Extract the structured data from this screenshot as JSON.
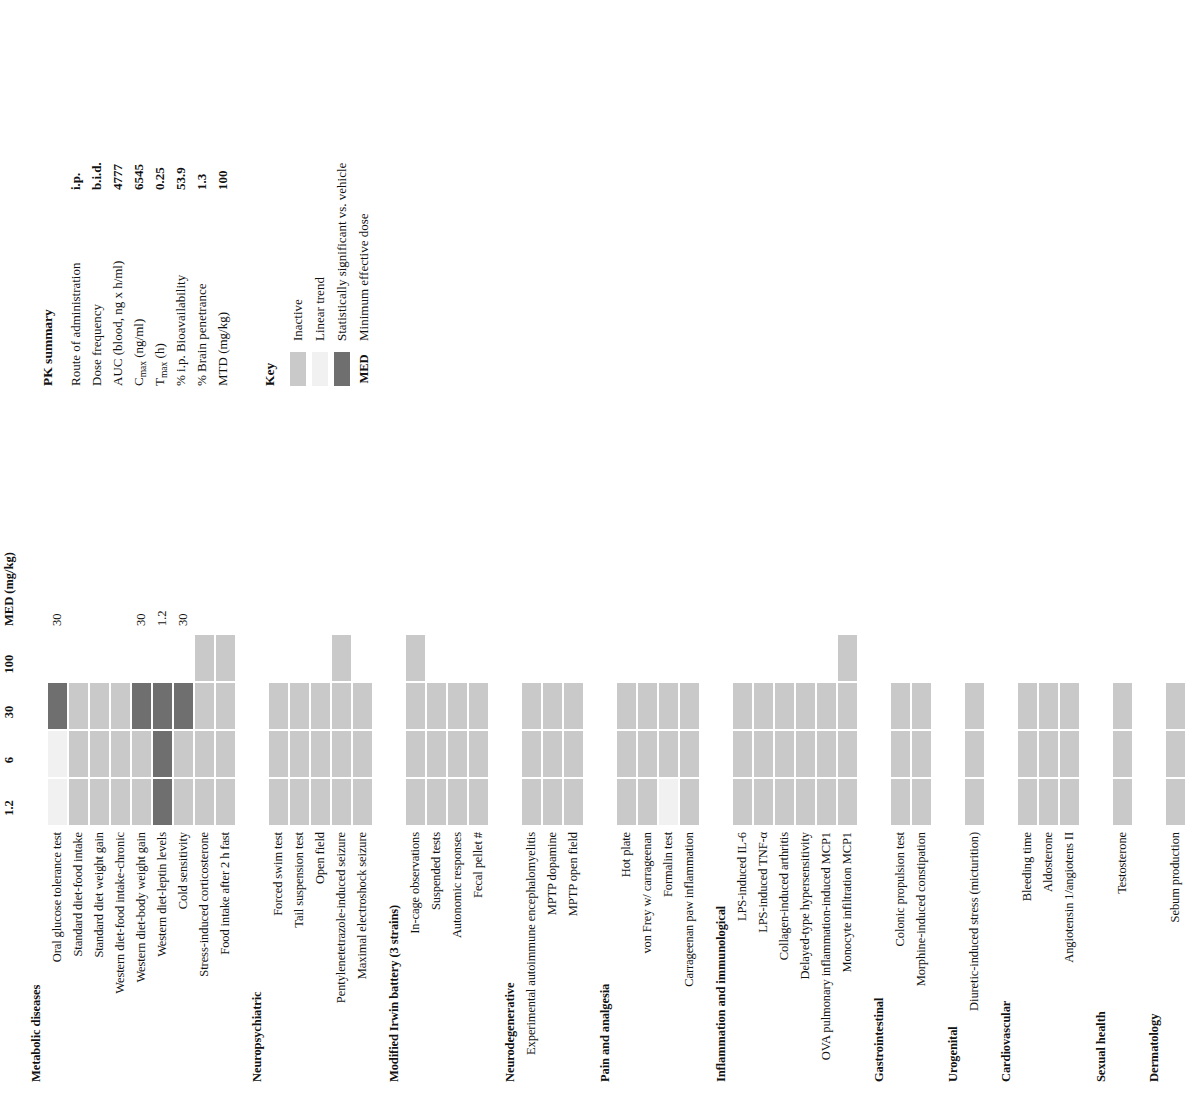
{
  "figure": {
    "dose_axis_title": "Dose (mg/kg)",
    "dose_ticks": [
      "1.2",
      "6",
      "30",
      "100"
    ],
    "med_column_header": "MED (mg/kg)"
  },
  "chart_data": {
    "type": "heatmap",
    "title": "Dose (mg/kg)",
    "xlabel": "Dose (mg/kg)",
    "ylabel": "",
    "categories": [
      "1.2",
      "6",
      "30",
      "100"
    ],
    "extra_column": "MED (mg/kg)",
    "cell_states": [
      "none",
      "inactive",
      "trend",
      "sig"
    ],
    "legend_position": "right",
    "grid": false,
    "sections": [
      {
        "name": "Metabolic diseases",
        "rows": [
          {
            "label": "Oral glucose tolerance test",
            "cells": [
              "trend",
              "trend",
              "sig",
              "none"
            ],
            "med": "30"
          },
          {
            "label": "Standard diet-food intake",
            "cells": [
              "inactive",
              "inactive",
              "inactive",
              "none"
            ],
            "med": ""
          },
          {
            "label": "Standard diet weight gain",
            "cells": [
              "inactive",
              "inactive",
              "inactive",
              "none"
            ],
            "med": ""
          },
          {
            "label": "Western diet-food intake-chronic",
            "cells": [
              "inactive",
              "inactive",
              "inactive",
              "none"
            ],
            "med": ""
          },
          {
            "label": "Western diet-body weight gain",
            "cells": [
              "inactive",
              "inactive",
              "sig",
              "none"
            ],
            "med": "30"
          },
          {
            "label": "Western diet-leptin levels",
            "cells": [
              "sig",
              "sig",
              "sig",
              "none"
            ],
            "med": "1.2"
          },
          {
            "label": "Cold sensitivity",
            "cells": [
              "inactive",
              "inactive",
              "sig",
              "none"
            ],
            "med": "30"
          },
          {
            "label": "Stress-induced corticosterone",
            "cells": [
              "inactive",
              "inactive",
              "inactive",
              "inactive"
            ],
            "med": ""
          },
          {
            "label": "Food intake after 2 h fast",
            "cells": [
              "inactive",
              "inactive",
              "inactive",
              "inactive"
            ],
            "med": ""
          }
        ]
      },
      {
        "name": "Neuropsychiatric",
        "rows": [
          {
            "label": "Forced swim test",
            "cells": [
              "inactive",
              "inactive",
              "inactive",
              "none"
            ],
            "med": ""
          },
          {
            "label": "Tail suspension test",
            "cells": [
              "inactive",
              "inactive",
              "inactive",
              "none"
            ],
            "med": ""
          },
          {
            "label": "Open field",
            "cells": [
              "inactive",
              "inactive",
              "inactive",
              "none"
            ],
            "med": ""
          },
          {
            "label": "Pentylenetetrazole-induced seizure",
            "cells": [
              "inactive",
              "inactive",
              "inactive",
              "inactive"
            ],
            "med": ""
          },
          {
            "label": "Maximal electroshock seizure",
            "cells": [
              "inactive",
              "inactive",
              "inactive",
              "none"
            ],
            "med": ""
          }
        ]
      },
      {
        "name": "Modified Irwin battery (3 strains)",
        "rows": [
          {
            "label": "In-cage observations",
            "cells": [
              "inactive",
              "inactive",
              "inactive",
              "inactive"
            ],
            "med": ""
          },
          {
            "label": "Suspended tests",
            "cells": [
              "inactive",
              "inactive",
              "inactive",
              "none"
            ],
            "med": ""
          },
          {
            "label": "Autonomic responses",
            "cells": [
              "inactive",
              "inactive",
              "inactive",
              "none"
            ],
            "med": ""
          },
          {
            "label": "Fecal pellet #",
            "cells": [
              "inactive",
              "inactive",
              "inactive",
              "none"
            ],
            "med": ""
          }
        ]
      },
      {
        "name": "Neurodegenerative",
        "rows": [
          {
            "label": "Experimental autoimmune encephalomyelitis",
            "cells": [
              "inactive",
              "inactive",
              "inactive",
              "none"
            ],
            "med": ""
          },
          {
            "label": "MPTP dopamine",
            "cells": [
              "inactive",
              "inactive",
              "inactive",
              "none"
            ],
            "med": ""
          },
          {
            "label": "MPTP open field",
            "cells": [
              "inactive",
              "inactive",
              "inactive",
              "none"
            ],
            "med": ""
          }
        ]
      },
      {
        "name": "Pain and analgesia",
        "rows": [
          {
            "label": "Hot plate",
            "cells": [
              "inactive",
              "inactive",
              "inactive",
              "none"
            ],
            "med": ""
          },
          {
            "label": "von Frey w/ carrageenan",
            "cells": [
              "inactive",
              "inactive",
              "inactive",
              "none"
            ],
            "med": ""
          },
          {
            "label": "Formalin test",
            "cells": [
              "trend",
              "inactive",
              "inactive",
              "none"
            ],
            "med": ""
          },
          {
            "label": "Carrageenan paw inflammation",
            "cells": [
              "inactive",
              "inactive",
              "inactive",
              "none"
            ],
            "med": ""
          }
        ]
      },
      {
        "name": "Inflammation and immunological",
        "rows": [
          {
            "label": "LPS-induced IL-6",
            "cells": [
              "inactive",
              "inactive",
              "inactive",
              "none"
            ],
            "med": ""
          },
          {
            "label": "LPS-induced TNF-α",
            "cells": [
              "inactive",
              "inactive",
              "inactive",
              "none"
            ],
            "med": ""
          },
          {
            "label": "Collagen-induced arthritis",
            "cells": [
              "inactive",
              "inactive",
              "inactive",
              "none"
            ],
            "med": ""
          },
          {
            "label": "Delayed-type hypersensitivity",
            "cells": [
              "inactive",
              "inactive",
              "inactive",
              "none"
            ],
            "med": ""
          },
          {
            "label": "OVA pulmonary inflammation-induced MCP1",
            "cells": [
              "inactive",
              "inactive",
              "inactive",
              "none"
            ],
            "med": ""
          },
          {
            "label": "Monocyte infiltration MCP1",
            "cells": [
              "inactive",
              "inactive",
              "inactive",
              "inactive"
            ],
            "med": ""
          }
        ]
      },
      {
        "name": "Gastrointestinal",
        "rows": [
          {
            "label": "Colonic propulsion test",
            "cells": [
              "inactive",
              "inactive",
              "inactive",
              "none"
            ],
            "med": ""
          },
          {
            "label": "Morphine-induced constipation",
            "cells": [
              "inactive",
              "inactive",
              "inactive",
              "none"
            ],
            "med": ""
          }
        ]
      },
      {
        "name": "Urogenital",
        "rows": [
          {
            "label": "Diuretic-induced stress (micturition)",
            "cells": [
              "inactive",
              "inactive",
              "inactive",
              "none"
            ],
            "med": ""
          }
        ]
      },
      {
        "name": "Cardiovascular",
        "rows": [
          {
            "label": "Bleeding time",
            "cells": [
              "inactive",
              "inactive",
              "inactive",
              "none"
            ],
            "med": ""
          },
          {
            "label": "Aldosterone",
            "cells": [
              "inactive",
              "inactive",
              "inactive",
              "none"
            ],
            "med": ""
          },
          {
            "label": "Angiotensin 1/angiotens II",
            "cells": [
              "inactive",
              "inactive",
              "inactive",
              "none"
            ],
            "med": ""
          }
        ]
      },
      {
        "name": "Sexual health",
        "rows": [
          {
            "label": "Testosterone",
            "cells": [
              "inactive",
              "inactive",
              "inactive",
              "none"
            ],
            "med": ""
          }
        ]
      },
      {
        "name": "Dermatology",
        "rows": [
          {
            "label": "Sebum production",
            "cells": [
              "inactive",
              "inactive",
              "inactive",
              "none"
            ],
            "med": ""
          }
        ]
      }
    ]
  },
  "pk_summary": {
    "title": "PK summary",
    "rows": [
      {
        "name": "Route of administration",
        "value": "i.p."
      },
      {
        "name": "Dose frequency",
        "value": "b.i.d."
      },
      {
        "name": "AUC (blood, ng x h/ml)",
        "value": "4777"
      },
      {
        "name": "Cmax (ng/ml)",
        "name_base": "C",
        "name_sub": "max",
        "name_rest": " (ng/ml)",
        "value": "6545"
      },
      {
        "name": "Tmax (h)",
        "name_base": "T",
        "name_sub": "max",
        "name_rest": " (h)",
        "value": "0.25"
      },
      {
        "name": "% i.p. Bioavailability",
        "value": "53.9"
      },
      {
        "name": "% Brain penetrance",
        "value": "1.3"
      },
      {
        "name": "MTD (mg/kg)",
        "value": "100"
      }
    ]
  },
  "key": {
    "title": "Key",
    "items": [
      {
        "label": "Inactive",
        "swatch": "inactive",
        "text": ""
      },
      {
        "label": "Linear trend",
        "swatch": "trend",
        "text": ""
      },
      {
        "label": "Statistically significant vs. vehicle",
        "swatch": "sig",
        "text": ""
      },
      {
        "label": "Minimum effective dose",
        "swatch": "text",
        "text": "MED"
      }
    ]
  },
  "colors": {
    "inactive": "#c9c9c9",
    "trend": "#f1f1f1",
    "significant": "#6f6f6f",
    "background": "#ffffff",
    "text": "#111111"
  }
}
